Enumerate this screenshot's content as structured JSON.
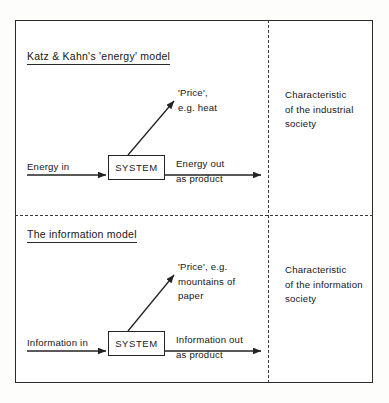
{
  "figure": {
    "type": "diagram",
    "panels": [
      {
        "id": "energy",
        "title": "Katz & Kahn's 'energy' model",
        "input_label": "Energy in",
        "process_label": "SYSTEM",
        "output_label": "Energy out\nas product",
        "output_label_lines": [
          "Energy out",
          "as product"
        ],
        "byproduct_label_lines": [
          "'Price',",
          "e.g. heat"
        ],
        "characteristic_lines": [
          "Characteristic",
          "of the industrial",
          "society"
        ]
      },
      {
        "id": "information",
        "title": "The information model",
        "input_label": "Information in",
        "process_label": "SYSTEM",
        "output_label": "Information out\nas product",
        "output_label_lines": [
          "Information out",
          "as product"
        ],
        "byproduct_label_lines": [
          "'Price', e.g.",
          "mountains of",
          "paper"
        ],
        "characteristic_lines": [
          "Characteristic",
          "of the information",
          "society"
        ]
      }
    ]
  },
  "colors": {
    "ink": "#1a1a1a",
    "line": "#232323",
    "divider": "#3a3a3a",
    "paper": "#ffffff"
  }
}
